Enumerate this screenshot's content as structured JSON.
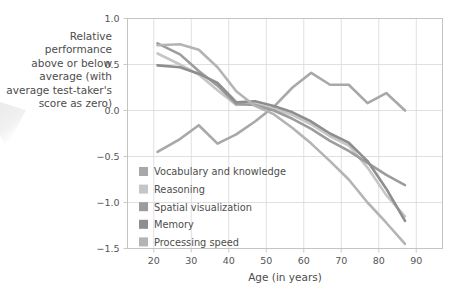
{
  "figure": {
    "y_axis_caption": "Relative performance\nabove or below\naverage (with\naverage test-taker's\nscore as zero)",
    "x_axis_title": "Age (in years)"
  },
  "chart_data": {
    "type": "line",
    "title": "",
    "subtitle": "",
    "xlabel": "Age (in years)",
    "ylabel": "Relative performance above or below average (with average test-taker's score as zero)",
    "xlim": [
      13,
      97
    ],
    "ylim": [
      -1.5,
      1.0
    ],
    "xticks": [
      20,
      30,
      40,
      50,
      60,
      70,
      80,
      90
    ],
    "yticks": [
      1.0,
      0.5,
      0.0,
      -0.5,
      -1.0,
      -1.5
    ],
    "ytick_labels": [
      "1.0",
      "0.5",
      "0.0",
      "−0.5",
      "−1.0",
      "−1.5"
    ],
    "xtick_labels": [
      "20",
      "30",
      "40",
      "50",
      "60",
      "70",
      "80",
      "90"
    ],
    "grid": true,
    "legend_position": "inside-lower-left",
    "series": [
      {
        "name": "Vocabulary and knowledge",
        "color": "#a8a8a8",
        "x": [
          21,
          27,
          32,
          37,
          42,
          47,
          52,
          57,
          62,
          67,
          72,
          77,
          82,
          87
        ],
        "y": [
          -0.45,
          -0.31,
          -0.16,
          -0.36,
          -0.26,
          -0.12,
          0.04,
          0.25,
          0.41,
          0.28,
          0.28,
          0.08,
          0.19,
          0.0
        ]
      },
      {
        "name": "Reasoning",
        "color": "#c6c6c6",
        "x": [
          21,
          27,
          32,
          37,
          42,
          47,
          52,
          57,
          62,
          67,
          72,
          77,
          82,
          87
        ],
        "y": [
          0.62,
          0.5,
          0.39,
          0.22,
          0.06,
          0.07,
          0.02,
          -0.05,
          -0.15,
          -0.28,
          -0.38,
          -0.62,
          -0.92,
          -1.15
        ]
      },
      {
        "name": "Spatial visualization",
        "color": "#9c9c9c",
        "x": [
          21,
          27,
          32,
          37,
          42,
          47,
          52,
          57,
          62,
          67,
          72,
          77,
          82,
          87
        ],
        "y": [
          0.73,
          0.61,
          0.43,
          0.27,
          0.07,
          0.06,
          0.0,
          -0.09,
          -0.2,
          -0.33,
          -0.44,
          -0.57,
          -0.7,
          -0.81
        ]
      },
      {
        "name": "Memory",
        "color": "#8e8e8e",
        "x": [
          21,
          27,
          32,
          37,
          42,
          47,
          52,
          57,
          62,
          67,
          72,
          77,
          82,
          87
        ],
        "y": [
          0.49,
          0.47,
          0.4,
          0.3,
          0.09,
          0.1,
          0.05,
          -0.02,
          -0.12,
          -0.25,
          -0.35,
          -0.55,
          -0.85,
          -1.2
        ]
      },
      {
        "name": "Processing speed",
        "color": "#b4b4b4",
        "x": [
          21,
          27,
          32,
          37,
          42,
          47,
          52,
          57,
          62,
          67,
          72,
          77,
          82,
          87
        ],
        "y": [
          0.71,
          0.72,
          0.66,
          0.47,
          0.21,
          0.05,
          -0.04,
          -0.19,
          -0.36,
          -0.55,
          -0.75,
          -1.0,
          -1.22,
          -1.45
        ]
      }
    ]
  },
  "legend": {
    "items": [
      {
        "label": "Vocabulary and knowledge",
        "color": "#a8a8a8"
      },
      {
        "label": "Reasoning",
        "color": "#c6c6c6"
      },
      {
        "label": "Spatial visualization",
        "color": "#9c9c9c"
      },
      {
        "label": "Memory",
        "color": "#8e8e8e"
      },
      {
        "label": "Processing speed",
        "color": "#b4b4b4"
      }
    ]
  }
}
